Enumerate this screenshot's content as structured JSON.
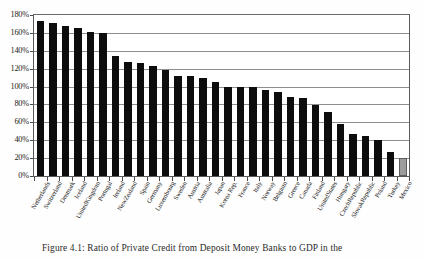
{
  "chart_data": {
    "type": "bar",
    "title": "",
    "xlabel": "",
    "ylabel": "",
    "ylim": [
      0,
      180
    ],
    "ytick_step": 20,
    "ytick_labels": [
      "0%",
      "20%",
      "40%",
      "60%",
      "80%",
      "100%",
      "120%",
      "140%",
      "160%",
      "180%"
    ],
    "ytick_values": [
      0,
      20,
      40,
      60,
      80,
      100,
      120,
      140,
      160,
      180
    ],
    "grid": true,
    "legend": "none",
    "bar_color": "#0d0d0d",
    "highlight_color": "#9d9d9d",
    "highlight_category": "Mexico",
    "categories": [
      "Netherlands",
      "Switzerland",
      "Denmark",
      "Iceland",
      "UnitedKingdom",
      "Portugal",
      "Ireland",
      "NewZealand",
      "Spain",
      "Germany",
      "Luxembourg",
      "Sweden",
      "Austria",
      "Australia",
      "Japan",
      "Korea Rep.",
      "France",
      "Italy",
      "Norway",
      "Belgium",
      "Greece",
      "Canada",
      "Finland",
      "UnitedStates",
      "Hungary",
      "CzechRepublic",
      "SlovakRepublic",
      "Poland",
      "Turkey",
      "Mexico"
    ],
    "values": [
      173,
      171,
      168,
      165,
      161,
      160,
      134,
      127,
      126,
      123,
      118,
      112,
      112,
      110,
      105,
      100,
      99,
      99,
      96,
      94,
      88,
      87,
      79,
      72,
      58,
      47,
      45,
      40,
      27,
      20
    ]
  },
  "caption": {
    "text": "Figure 4.1: Ratio of Private Credit from Deposit Money Banks to GDP in the"
  }
}
